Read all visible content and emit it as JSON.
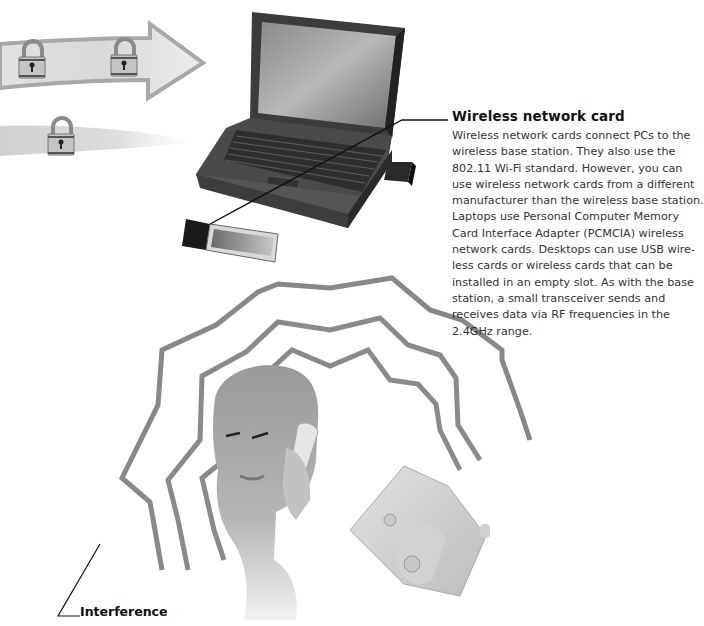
{
  "callouts": {
    "wireless_card": {
      "title": "Wireless network card",
      "body_lines": [
        "Wireless network cards connect PCs to the",
        "wireless base station. They also use the",
        "802.11 Wi-Fi standard. However, you can",
        "use wireless network cards from a different",
        "manufacturer than the wireless base station.",
        "Laptops use Personal Computer Memory",
        "Card Interface Adapter (PCMCIA) wireless",
        "network cards. Desktops can use USB wire-",
        "less cards or wireless cards that can be",
        "installed in an empty slot. As with the base",
        "station, a small transceiver sends and",
        "receives data via RF frequencies in the",
        "2.4GHz range."
      ]
    },
    "interference": {
      "title": "Interference"
    }
  },
  "illustration": {
    "elements": [
      "encrypted-data-arrow-with-padlocks",
      "fading-data-stream-with-padlock",
      "laptop",
      "pcmcia-wireless-card",
      "usb-wireless-adapter",
      "radio-interference-waves",
      "man-on-cordless-phone",
      "cordless-phone-base"
    ],
    "colors": {
      "background": "#ffffff",
      "arrow_fill": "#dcdcdc",
      "arrow_stroke": "#a8a8a8",
      "laptop_body": "#3a3a3a",
      "wave_stroke": "#7a7a7a",
      "text": "#333333",
      "title_text": "#111111"
    }
  }
}
